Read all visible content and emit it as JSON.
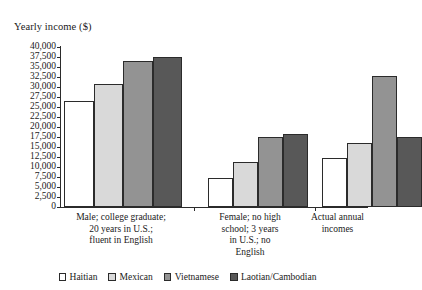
{
  "chart_data": {
    "type": "bar",
    "title": "Yearly income ($)",
    "xlabel": "",
    "ylabel": "Yearly income ($)",
    "ylim": [
      0,
      40000
    ],
    "ytick_step": 2500,
    "grid": false,
    "legend_position": "bottom",
    "ytick_labels": [
      "40,000",
      "37,500",
      "35,000",
      "32,500",
      "30,000",
      "27,500",
      "25,000",
      "22,500",
      "20,000",
      "17,500",
      "15,000",
      "12,500",
      "10,000",
      "7,500",
      "5,000",
      "2,500",
      "0"
    ],
    "ytick_values": [
      40000,
      37500,
      35000,
      32500,
      30000,
      27500,
      25000,
      22500,
      20000,
      17500,
      15000,
      12500,
      10000,
      7500,
      5000,
      2500,
      0
    ],
    "categories": [
      "Male; college graduate;\n20 years in U.S.;\nfluent in English",
      "Female; no high\nschool; 3 years\nin U.S.; no\nEnglish",
      "Actual annual\nincomes"
    ],
    "category_lines": [
      [
        "Male; college graduate;",
        "20 years in U.S.;",
        "fluent in English"
      ],
      [
        "Female; no high",
        "school; 3 years",
        "in U.S.; no",
        "English"
      ],
      [
        "Actual annual",
        "incomes"
      ]
    ],
    "series": [
      {
        "name": "Haitian",
        "color": "#ffffff",
        "values": [
          26500,
          7300,
          12300
        ]
      },
      {
        "name": "Mexican",
        "color": "#d9d9d9",
        "values": [
          30800,
          11300,
          15900
        ]
      },
      {
        "name": "Vietnamese",
        "color": "#939393",
        "values": [
          36500,
          17500,
          32800
        ]
      },
      {
        "name": "Laotian/Cambodian",
        "color": "#585858",
        "values": [
          37400,
          18200,
          17500
        ]
      }
    ]
  }
}
